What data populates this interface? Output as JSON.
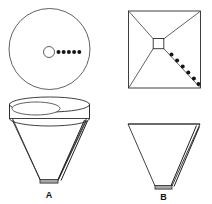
{
  "figure": {
    "background_color": "#ffffff",
    "line_color": "#2b2b2b",
    "accent_gray": "#a6a6a6",
    "dot_color": "#151515",
    "width": 212,
    "height": 204
  },
  "captions": {
    "left_label": "A",
    "right_label": "B"
  },
  "panels": {
    "top_left": {
      "name": "circular-top-view",
      "shape": "circle",
      "center": {
        "x": 49.5,
        "y": 49.0
      },
      "radius": 40.5,
      "inner_circle": {
        "cx": 49.0,
        "cy": 52.0,
        "r": 5.5
      },
      "dot_row": {
        "count": 5,
        "start_x": 58.5,
        "spacing": 5.2,
        "y": 52.0,
        "radius": 2.0
      }
    },
    "top_right": {
      "name": "square-top-view",
      "shape": "square",
      "left": 128.5,
      "top": 11.0,
      "right": 200.5,
      "bottom": 88.0,
      "center_square": {
        "x": 158.0,
        "y": 43.5,
        "size": 10.5
      },
      "diagonals": 4,
      "dot_row": {
        "count": 6,
        "start_x": 171.5,
        "start_y": 54.5,
        "step_x": 5.6,
        "step_y": 6.0,
        "radius": 2.0
      }
    },
    "bottom_left": {
      "name": "conical-funnel-elevation",
      "rim_ellipse": {
        "cx": 49.5,
        "cy": 112.0,
        "rx": 40.0,
        "ry": 8.0
      },
      "inner_ellipse": {
        "cx": 36.0,
        "cy": 109.0,
        "rx": 24.0,
        "ry": 6.5
      },
      "body_top_y": 118.5,
      "apex": {
        "x": 49.0,
        "y": 182.0
      },
      "tip_bar": {
        "x": 40.0,
        "y": 180.0,
        "width": 18.0,
        "height": 3.5
      },
      "rod": {
        "x1": 84.5,
        "y1": 120.0,
        "x2": 58.0,
        "y2": 180.0
      }
    },
    "bottom_right": {
      "name": "pyramidal-funnel-elevation",
      "top_left": {
        "x": 128.0,
        "y": 124.0
      },
      "top_right": {
        "x": 200.0,
        "y": 124.0
      },
      "apex": {
        "x": 163.0,
        "y": 188.0
      },
      "tip_bar": {
        "x": 155.0,
        "y": 186.0,
        "width": 17.0,
        "height": 3.5
      },
      "rod": {
        "x1": 196.0,
        "y1": 126.0,
        "x2": 171.0,
        "y2": 186.0
      }
    }
  }
}
